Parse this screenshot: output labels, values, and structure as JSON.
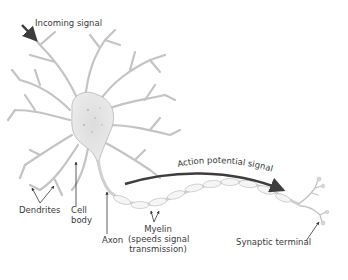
{
  "labels": {
    "incoming_signal": "Incoming signal",
    "dendrites": "Dendrites",
    "cell_body_line1": "Cell",
    "cell_body_line2": "body",
    "axon": "Axon",
    "myelin_line1": "Myelin",
    "myelin_line2": "(speeds signal",
    "myelin_line3": "transmission)",
    "action_potential": "Action potential signal",
    "synaptic_terminal": "Synaptic terminal"
  },
  "colors": {
    "arrow": "#3d3d3d",
    "neuron_fill": "#e6e6e6",
    "neuron_stroke": "#b5b5b5",
    "myelin_fill": "#f4f4f4",
    "text": "#3a3a3a"
  }
}
